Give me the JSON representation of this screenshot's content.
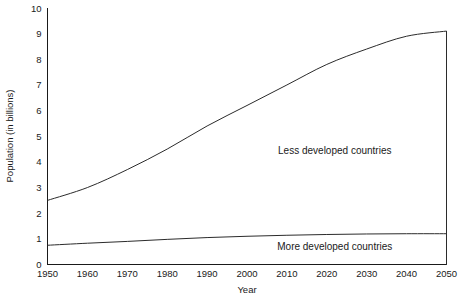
{
  "chart_data": {
    "type": "line",
    "title": "",
    "xlabel": "Year",
    "ylabel": "Population (in billions)",
    "xlim": [
      1950,
      2050
    ],
    "ylim": [
      0,
      10
    ],
    "grid": false,
    "legend_position": "inline-annotations",
    "x": [
      1950,
      1960,
      1970,
      1980,
      1990,
      2000,
      2010,
      2020,
      2030,
      2040,
      2050
    ],
    "xtick_labels": [
      "1950",
      "1960",
      "1970",
      "1980",
      "1990",
      "2000",
      "2010",
      "2020",
      "2030",
      "2040",
      "2050"
    ],
    "ytick_labels": [
      "0",
      "1",
      "2",
      "3",
      "4",
      "5",
      "6",
      "7",
      "8",
      "9",
      "10"
    ],
    "ytick_values": [
      0,
      1,
      2,
      3,
      4,
      5,
      6,
      7,
      8,
      9,
      10
    ],
    "series": [
      {
        "name": "Less developed countries",
        "values": [
          2.5,
          3.0,
          3.7,
          4.5,
          5.4,
          6.2,
          7.0,
          7.8,
          8.4,
          8.9,
          9.1
        ],
        "annotation": "Less developed countries",
        "annotation_x": 2022,
        "annotation_y": 4.3
      },
      {
        "name": "More developed countries",
        "values": [
          0.75,
          0.83,
          0.9,
          0.98,
          1.05,
          1.1,
          1.14,
          1.17,
          1.19,
          1.2,
          1.2
        ],
        "annotation": "More developed countries",
        "annotation_x": 2022,
        "annotation_y": 0.58
      }
    ]
  },
  "axes": {
    "y_title": "Population (in billions)",
    "x_title": "Year"
  },
  "ticks": {
    "y": [
      {
        "label": "10",
        "value": 10
      },
      {
        "label": "9",
        "value": 9
      },
      {
        "label": "8",
        "value": 8
      },
      {
        "label": "7",
        "value": 7
      },
      {
        "label": "6",
        "value": 6
      },
      {
        "label": "5",
        "value": 5
      },
      {
        "label": "4",
        "value": 4
      },
      {
        "label": "3",
        "value": 3
      },
      {
        "label": "2",
        "value": 2
      },
      {
        "label": "1",
        "value": 1
      },
      {
        "label": "0",
        "value": 0
      }
    ],
    "x": [
      {
        "label": "1950",
        "value": 1950
      },
      {
        "label": "1960",
        "value": 1960
      },
      {
        "label": "1970",
        "value": 1970
      },
      {
        "label": "1980",
        "value": 1980
      },
      {
        "label": "1990",
        "value": 1990
      },
      {
        "label": "2000",
        "value": 2000
      },
      {
        "label": "2010",
        "value": 2010
      },
      {
        "label": "2020",
        "value": 2020
      },
      {
        "label": "2030",
        "value": 2030
      },
      {
        "label": "2040",
        "value": 2040
      },
      {
        "label": "2050",
        "value": 2050
      }
    ]
  },
  "annotations": [
    {
      "text": "Less developed countries"
    },
    {
      "text": "More developed countries"
    }
  ],
  "colors": {
    "line": "#2b2b2b",
    "axis": "#1a1a1a",
    "text": "#1a1a1a",
    "background": "#ffffff"
  }
}
